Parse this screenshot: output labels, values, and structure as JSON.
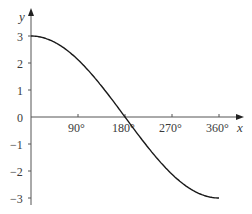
{
  "chart_data": {
    "type": "line",
    "title": "",
    "xlabel": "x",
    "ylabel": "y",
    "function": "y = 3cos(x/2)",
    "xlim": [
      0,
      360
    ],
    "ylim": [
      -3,
      3
    ],
    "x_ticks": [
      "90°",
      "180°",
      "270°",
      "360°"
    ],
    "y_ticks": [
      "3",
      "2",
      "1",
      "0",
      "−1",
      "−2",
      "−3"
    ],
    "grid": false,
    "legend": null,
    "series": [
      {
        "name": "curve",
        "x": [
          0,
          45,
          90,
          135,
          180,
          225,
          270,
          315,
          360
        ],
        "y": [
          3,
          2.77,
          2.12,
          1.15,
          0,
          -1.15,
          -2.12,
          -2.77,
          -3
        ]
      }
    ],
    "colors": {
      "axis": "#555555",
      "curve": "#1a1a1a",
      "text": "#3a3a3a"
    }
  }
}
